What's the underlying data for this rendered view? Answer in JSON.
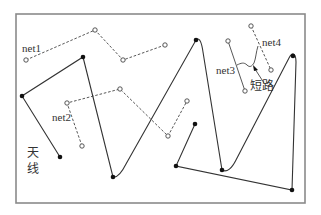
{
  "diagram": {
    "labels": {
      "net1": "net1",
      "net2": "net2",
      "net3": "net3",
      "net4": "net4",
      "short": "短路",
      "antenna_line1": "天",
      "antenna_line2": "线"
    },
    "colors": {
      "frame": "#8a8a8a",
      "trace": "#333333",
      "background": "#ffffff"
    },
    "legend_semantics": {
      "solid_line_filled_dots": "antenna trace",
      "dashed_line_open_circles": "nets"
    }
  }
}
